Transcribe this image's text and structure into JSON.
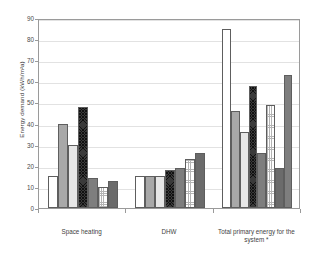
{
  "chart_data": {
    "type": "bar",
    "title": "",
    "xlabel": "",
    "ylabel": "Energy demand (kWh/m²a)",
    "ylim": [
      0,
      90
    ],
    "ytick_step": 10,
    "yticks": [
      0,
      10,
      20,
      30,
      40,
      50,
      60,
      70,
      80,
      90
    ],
    "grid": true,
    "legend": "none",
    "categories": [
      "Space heating",
      "DHW",
      "Total primary energy for the system *"
    ],
    "series": [
      {
        "name": "Series 1",
        "pattern": "dots-light",
        "values": [
          15,
          15,
          85
        ]
      },
      {
        "name": "Series 2",
        "pattern": "solid-gray",
        "values": [
          40,
          15,
          46
        ]
      },
      {
        "name": "Series 3",
        "pattern": "hatch-light",
        "values": [
          30,
          15,
          36
        ]
      },
      {
        "name": "Series 4",
        "pattern": "crosshatch-dark",
        "values": [
          48,
          18,
          58
        ]
      },
      {
        "name": "Series 5",
        "pattern": "solid-mid",
        "values": [
          14,
          19,
          26
        ]
      },
      {
        "name": "Series 6",
        "pattern": "check-light",
        "values": [
          10,
          23,
          49
        ]
      },
      {
        "name": "Series 7",
        "pattern": "solid-dark",
        "values": [
          13,
          26,
          19
        ]
      },
      {
        "name": "Series 8",
        "pattern": "solid-mid",
        "values": [
          null,
          null,
          63
        ]
      }
    ]
  },
  "axis": {
    "y_title": "Energy demand (kWh/m²a)",
    "tick_labels": [
      "90",
      "80",
      "70",
      "60",
      "50",
      "40",
      "30",
      "20",
      "10",
      "0"
    ]
  },
  "x_labels": {
    "cat1": "Space heating",
    "cat2": "DHW",
    "cat3_line1": "Total primary energy for the",
    "cat3_line2": "system *"
  }
}
